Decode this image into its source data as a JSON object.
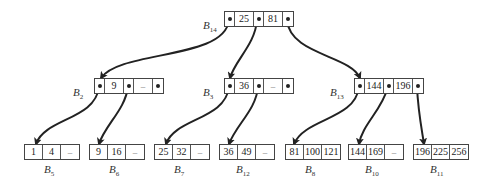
{
  "diagram": {
    "type": "b-tree",
    "root": {
      "id": "B14",
      "label_base": "B",
      "label_sub": "14",
      "keys": [
        "25",
        "81"
      ],
      "pointers": 3
    },
    "internal": [
      {
        "id": "B2",
        "label_base": "B",
        "label_sub": "2",
        "keys": [
          "9",
          "–"
        ],
        "pointers": 3
      },
      {
        "id": "B3",
        "label_base": "B",
        "label_sub": "3",
        "keys": [
          "36",
          "–"
        ],
        "pointers": 3
      },
      {
        "id": "B13",
        "label_base": "B",
        "label_sub": "13",
        "keys": [
          "144",
          "196"
        ],
        "pointers": 3
      }
    ],
    "leaves": [
      {
        "id": "B5",
        "label_base": "B",
        "label_sub": "5",
        "keys": [
          "1",
          "4",
          "–"
        ]
      },
      {
        "id": "B6",
        "label_base": "B",
        "label_sub": "6",
        "keys": [
          "9",
          "16",
          "–"
        ]
      },
      {
        "id": "B7",
        "label_base": "B",
        "label_sub": "7",
        "keys": [
          "25",
          "32",
          "–"
        ]
      },
      {
        "id": "B12",
        "label_base": "B",
        "label_sub": "12",
        "keys": [
          "36",
          "49",
          "–"
        ]
      },
      {
        "id": "B8",
        "label_base": "B",
        "label_sub": "8",
        "keys": [
          "81",
          "100",
          "121"
        ]
      },
      {
        "id": "B10",
        "label_base": "B",
        "label_sub": "10",
        "keys": [
          "144",
          "169",
          "–"
        ]
      },
      {
        "id": "B11",
        "label_base": "B",
        "label_sub": "11",
        "keys": [
          "196",
          "225",
          "256"
        ]
      }
    ],
    "edges": [
      {
        "from": "B14",
        "to": "B2"
      },
      {
        "from": "B14",
        "to": "B3"
      },
      {
        "from": "B14",
        "to": "B13"
      },
      {
        "from": "B2",
        "to": "B5"
      },
      {
        "from": "B2",
        "to": "B6"
      },
      {
        "from": "B3",
        "to": "B7"
      },
      {
        "from": "B3",
        "to": "B12"
      },
      {
        "from": "B13",
        "to": "B8"
      },
      {
        "from": "B13",
        "to": "B10"
      },
      {
        "from": "B13",
        "to": "B11"
      }
    ]
  }
}
